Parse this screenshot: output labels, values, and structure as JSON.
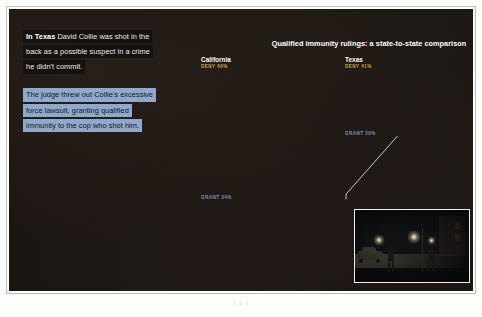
{
  "narrative": {
    "paragraph1": {
      "lead": "In Texas",
      "lines": [
        "David Collie was shot in the",
        "back as a possible suspect in a crime",
        "he didn't commit."
      ]
    },
    "paragraph2": {
      "lines": [
        "The judge threw out Collie's excessive",
        "force lawsuit, granting qualified",
        "immunity to the cop who shot him."
      ]
    }
  },
  "chart": {
    "title": "Qualified immunity rulings: a state-to-state comparison",
    "states": [
      {
        "name": "California",
        "deny_label": "DENY 66%",
        "grant_label": "GRANT 34%",
        "deny_pct": 66,
        "grant_pct": 34
      },
      {
        "name": "Texas",
        "deny_label": "DENY 41%",
        "grant_label": "GRANT 59%",
        "deny_pct": 41,
        "grant_pct": 59
      }
    ]
  },
  "chart_data": {
    "type": "bar",
    "title": "Qualified immunity rulings: a state-to-state comparison",
    "subtype": "waffle / unit chart",
    "categories": [
      "California",
      "Texas"
    ],
    "series": [
      {
        "name": "DENY",
        "values": [
          66,
          41
        ],
        "color": "#e6cf69"
      },
      {
        "name": "GRANT",
        "values": [
          34,
          59
        ],
        "color": "#a9bddb"
      }
    ],
    "xlabel": "",
    "ylabel": "Share of rulings (%)",
    "ylim": [
      0,
      100
    ],
    "grid": false,
    "legend": "inline labels above each block",
    "annotations": [
      "Highlighted single unit in the Texas GRANT block linked by a leader line to a photograph"
    ],
    "units_note": "Each small square represents 1% of rulings"
  },
  "colors": {
    "deny_yellow": "#e6cf69",
    "grant_blue": "#a9bddb",
    "panel_background": "#1a1512",
    "highlight_band_blue": "#8fa8cc"
  },
  "photo": {
    "alt": "Night-time street scene with parked car and two standing figures",
    "highlight_marker": "highlighted-cell-marker"
  },
  "caption": {
    "text": "( 1 )"
  }
}
